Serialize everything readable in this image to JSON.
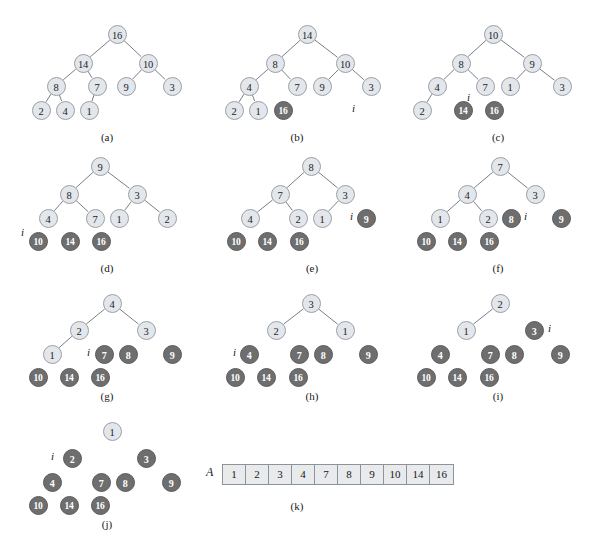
{
  "figure": {
    "colors": {
      "light_node_fill": "#e3e6ea",
      "light_node_stroke": "#9aa0a8",
      "dark_node_fill": "#6e6e6e",
      "dark_node_stroke": "#5a5a5a",
      "edge": "#6b6f75",
      "array_fill": "#e8eaec",
      "array_stroke": "#8d9399",
      "text": "#15181c",
      "background": "#ffffff"
    },
    "index_marker_label": "i",
    "array_name_label": "A"
  },
  "panels": [
    {
      "id": "a",
      "caption": "(a)",
      "caption_pos": [
        107,
        131
      ],
      "index_marker": null,
      "nodes": [
        {
          "label": "16",
          "x": 117,
          "y": 34,
          "shade": "light"
        },
        {
          "label": "14",
          "x": 83,
          "y": 63,
          "shade": "light"
        },
        {
          "label": "10",
          "x": 148,
          "y": 63,
          "shade": "light"
        },
        {
          "label": "8",
          "x": 56,
          "y": 86,
          "shade": "light"
        },
        {
          "label": "7",
          "x": 97,
          "y": 86,
          "shade": "light"
        },
        {
          "label": "9",
          "x": 126,
          "y": 86,
          "shade": "light"
        },
        {
          "label": "3",
          "x": 172,
          "y": 86,
          "shade": "light"
        },
        {
          "label": "2",
          "x": 41,
          "y": 110,
          "shade": "light"
        },
        {
          "label": "4",
          "x": 65,
          "y": 110,
          "shade": "light"
        },
        {
          "label": "1",
          "x": 89,
          "y": 110,
          "shade": "light"
        }
      ],
      "edges": [
        [
          0,
          1
        ],
        [
          0,
          2
        ],
        [
          1,
          3
        ],
        [
          1,
          4
        ],
        [
          2,
          5
        ],
        [
          2,
          6
        ],
        [
          3,
          7
        ],
        [
          3,
          8
        ],
        [
          4,
          9
        ]
      ]
    },
    {
      "id": "b",
      "caption": "(b)",
      "caption_pos": [
        297,
        131
      ],
      "index_marker": {
        "x": 355,
        "y": 110
      },
      "nodes": [
        {
          "label": "14",
          "x": 307,
          "y": 34,
          "shade": "light"
        },
        {
          "label": "8",
          "x": 275,
          "y": 63,
          "shade": "light"
        },
        {
          "label": "10",
          "x": 345,
          "y": 63,
          "shade": "light"
        },
        {
          "label": "4",
          "x": 249,
          "y": 86,
          "shade": "light"
        },
        {
          "label": "7",
          "x": 297,
          "y": 86,
          "shade": "light"
        },
        {
          "label": "9",
          "x": 322,
          "y": 86,
          "shade": "light"
        },
        {
          "label": "3",
          "x": 371,
          "y": 86,
          "shade": "light"
        },
        {
          "label": "2",
          "x": 234,
          "y": 110,
          "shade": "light"
        },
        {
          "label": "1",
          "x": 258,
          "y": 110,
          "shade": "light"
        },
        {
          "label": "16",
          "x": 283,
          "y": 110,
          "shade": "dark"
        }
      ],
      "edges": [
        [
          0,
          1
        ],
        [
          0,
          2
        ],
        [
          1,
          3
        ],
        [
          1,
          4
        ],
        [
          2,
          5
        ],
        [
          2,
          6
        ],
        [
          3,
          7
        ],
        [
          3,
          8
        ]
      ]
    },
    {
      "id": "c",
      "caption": "(c)",
      "caption_pos": [
        498,
        131
      ],
      "index_marker": {
        "x": 470,
        "y": 99
      },
      "nodes": [
        {
          "label": "10",
          "x": 493,
          "y": 34,
          "shade": "light"
        },
        {
          "label": "8",
          "x": 461,
          "y": 63,
          "shade": "light"
        },
        {
          "label": "9",
          "x": 532,
          "y": 63,
          "shade": "light"
        },
        {
          "label": "4",
          "x": 437,
          "y": 86,
          "shade": "light"
        },
        {
          "label": "7",
          "x": 485,
          "y": 86,
          "shade": "light"
        },
        {
          "label": "1",
          "x": 510,
          "y": 86,
          "shade": "light"
        },
        {
          "label": "3",
          "x": 562,
          "y": 86,
          "shade": "light"
        },
        {
          "label": "2",
          "x": 422,
          "y": 110,
          "shade": "light"
        },
        {
          "label": "14",
          "x": 463,
          "y": 110,
          "shade": "dark"
        },
        {
          "label": "16",
          "x": 494,
          "y": 110,
          "shade": "dark"
        }
      ],
      "edges": [
        [
          0,
          1
        ],
        [
          0,
          2
        ],
        [
          1,
          3
        ],
        [
          1,
          4
        ],
        [
          2,
          5
        ],
        [
          2,
          6
        ],
        [
          3,
          7
        ]
      ]
    },
    {
      "id": "d",
      "caption": "(d)",
      "caption_pos": [
        107,
        262
      ],
      "index_marker": {
        "x": 24,
        "y": 234
      },
      "nodes": [
        {
          "label": "9",
          "x": 100,
          "y": 166,
          "shade": "light"
        },
        {
          "label": "8",
          "x": 69,
          "y": 194,
          "shade": "light"
        },
        {
          "label": "3",
          "x": 137,
          "y": 194,
          "shade": "light"
        },
        {
          "label": "4",
          "x": 48,
          "y": 218,
          "shade": "light"
        },
        {
          "label": "7",
          "x": 95,
          "y": 218,
          "shade": "light"
        },
        {
          "label": "1",
          "x": 119,
          "y": 218,
          "shade": "light"
        },
        {
          "label": "2",
          "x": 167,
          "y": 218,
          "shade": "light"
        },
        {
          "label": "10",
          "x": 38,
          "y": 241,
          "shade": "dark"
        },
        {
          "label": "14",
          "x": 70,
          "y": 241,
          "shade": "dark"
        },
        {
          "label": "16",
          "x": 101,
          "y": 241,
          "shade": "dark"
        }
      ],
      "edges": [
        [
          0,
          1
        ],
        [
          0,
          2
        ],
        [
          1,
          3
        ],
        [
          1,
          4
        ],
        [
          2,
          5
        ],
        [
          2,
          6
        ]
      ]
    },
    {
      "id": "e",
      "caption": "(e)",
      "caption_pos": [
        312,
        262
      ],
      "index_marker": {
        "x": 353,
        "y": 218
      },
      "nodes": [
        {
          "label": "8",
          "x": 311,
          "y": 166,
          "shade": "light"
        },
        {
          "label": "7",
          "x": 280,
          "y": 194,
          "shade": "light"
        },
        {
          "label": "3",
          "x": 345,
          "y": 194,
          "shade": "light"
        },
        {
          "label": "4",
          "x": 250,
          "y": 218,
          "shade": "light"
        },
        {
          "label": "2",
          "x": 298,
          "y": 218,
          "shade": "light"
        },
        {
          "label": "1",
          "x": 322,
          "y": 218,
          "shade": "light"
        },
        {
          "label": "9",
          "x": 366,
          "y": 218,
          "shade": "dark"
        },
        {
          "label": "10",
          "x": 236,
          "y": 241,
          "shade": "dark"
        },
        {
          "label": "14",
          "x": 267,
          "y": 241,
          "shade": "dark"
        },
        {
          "label": "16",
          "x": 299,
          "y": 241,
          "shade": "dark"
        }
      ],
      "edges": [
        [
          0,
          1
        ],
        [
          0,
          2
        ],
        [
          1,
          3
        ],
        [
          1,
          4
        ],
        [
          2,
          5
        ]
      ]
    },
    {
      "id": "f",
      "caption": "(f)",
      "caption_pos": [
        498,
        262
      ],
      "index_marker": {
        "x": 527,
        "y": 218
      },
      "nodes": [
        {
          "label": "7",
          "x": 500,
          "y": 166,
          "shade": "light"
        },
        {
          "label": "4",
          "x": 467,
          "y": 194,
          "shade": "light"
        },
        {
          "label": "3",
          "x": 535,
          "y": 194,
          "shade": "light"
        },
        {
          "label": "1",
          "x": 440,
          "y": 218,
          "shade": "light"
        },
        {
          "label": "2",
          "x": 488,
          "y": 218,
          "shade": "light"
        },
        {
          "label": "8",
          "x": 511,
          "y": 218,
          "shade": "dark"
        },
        {
          "label": "9",
          "x": 561,
          "y": 218,
          "shade": "dark"
        },
        {
          "label": "10",
          "x": 426,
          "y": 241,
          "shade": "dark"
        },
        {
          "label": "14",
          "x": 457,
          "y": 241,
          "shade": "dark"
        },
        {
          "label": "16",
          "x": 489,
          "y": 241,
          "shade": "dark"
        }
      ],
      "edges": [
        [
          0,
          1
        ],
        [
          0,
          2
        ],
        [
          1,
          3
        ],
        [
          1,
          4
        ]
      ]
    },
    {
      "id": "g",
      "caption": "(g)",
      "caption_pos": [
        107,
        390
      ],
      "index_marker": {
        "x": 90,
        "y": 354
      },
      "nodes": [
        {
          "label": "4",
          "x": 112,
          "y": 303,
          "shade": "light"
        },
        {
          "label": "2",
          "x": 79,
          "y": 330,
          "shade": "light"
        },
        {
          "label": "3",
          "x": 146,
          "y": 330,
          "shade": "light"
        },
        {
          "label": "1",
          "x": 52,
          "y": 354,
          "shade": "light"
        },
        {
          "label": "7",
          "x": 104,
          "y": 354,
          "shade": "dark"
        },
        {
          "label": "8",
          "x": 128,
          "y": 354,
          "shade": "dark"
        },
        {
          "label": "9",
          "x": 172,
          "y": 354,
          "shade": "dark"
        },
        {
          "label": "10",
          "x": 38,
          "y": 377,
          "shade": "dark"
        },
        {
          "label": "14",
          "x": 69,
          "y": 377,
          "shade": "dark"
        },
        {
          "label": "16",
          "x": 100,
          "y": 377,
          "shade": "dark"
        }
      ],
      "edges": [
        [
          0,
          1
        ],
        [
          0,
          2
        ],
        [
          1,
          3
        ]
      ]
    },
    {
      "id": "h",
      "caption": "(h)",
      "caption_pos": [
        312,
        390
      ],
      "index_marker": {
        "x": 236,
        "y": 354
      },
      "nodes": [
        {
          "label": "3",
          "x": 311,
          "y": 303,
          "shade": "light"
        },
        {
          "label": "2",
          "x": 276,
          "y": 330,
          "shade": "light"
        },
        {
          "label": "1",
          "x": 345,
          "y": 330,
          "shade": "light"
        },
        {
          "label": "4",
          "x": 249,
          "y": 354,
          "shade": "dark"
        },
        {
          "label": "7",
          "x": 299,
          "y": 354,
          "shade": "dark"
        },
        {
          "label": "8",
          "x": 323,
          "y": 354,
          "shade": "dark"
        },
        {
          "label": "9",
          "x": 368,
          "y": 354,
          "shade": "dark"
        },
        {
          "label": "10",
          "x": 235,
          "y": 377,
          "shade": "dark"
        },
        {
          "label": "14",
          "x": 266,
          "y": 377,
          "shade": "dark"
        },
        {
          "label": "16",
          "x": 298,
          "y": 377,
          "shade": "dark"
        }
      ],
      "edges": [
        [
          0,
          1
        ],
        [
          0,
          2
        ]
      ]
    },
    {
      "id": "i",
      "caption": "(i)",
      "caption_pos": [
        498,
        390
      ],
      "index_marker": {
        "x": 551,
        "y": 330
      },
      "nodes": [
        {
          "label": "2",
          "x": 500,
          "y": 303,
          "shade": "light"
        },
        {
          "label": "1",
          "x": 466,
          "y": 330,
          "shade": "light"
        },
        {
          "label": "3",
          "x": 534,
          "y": 330,
          "shade": "dark"
        },
        {
          "label": "4",
          "x": 440,
          "y": 354,
          "shade": "dark"
        },
        {
          "label": "7",
          "x": 490,
          "y": 354,
          "shade": "dark"
        },
        {
          "label": "8",
          "x": 514,
          "y": 354,
          "shade": "dark"
        },
        {
          "label": "9",
          "x": 560,
          "y": 354,
          "shade": "dark"
        },
        {
          "label": "10",
          "x": 426,
          "y": 377,
          "shade": "dark"
        },
        {
          "label": "14",
          "x": 457,
          "y": 377,
          "shade": "dark"
        },
        {
          "label": "16",
          "x": 489,
          "y": 377,
          "shade": "dark"
        }
      ],
      "edges": [
        [
          0,
          1
        ]
      ]
    },
    {
      "id": "j",
      "caption": "(j)",
      "caption_pos": [
        107,
        518
      ],
      "index_marker": {
        "x": 54,
        "y": 458
      },
      "nodes": [
        {
          "label": "1",
          "x": 112,
          "y": 431,
          "shade": "light"
        },
        {
          "label": "2",
          "x": 72,
          "y": 458,
          "shade": "dark"
        },
        {
          "label": "3",
          "x": 146,
          "y": 458,
          "shade": "dark"
        },
        {
          "label": "4",
          "x": 52,
          "y": 482,
          "shade": "dark"
        },
        {
          "label": "7",
          "x": 101,
          "y": 482,
          "shade": "dark"
        },
        {
          "label": "8",
          "x": 125,
          "y": 482,
          "shade": "dark"
        },
        {
          "label": "9",
          "x": 171,
          "y": 482,
          "shade": "dark"
        },
        {
          "label": "10",
          "x": 38,
          "y": 505,
          "shade": "dark"
        },
        {
          "label": "14",
          "x": 69,
          "y": 505,
          "shade": "dark"
        },
        {
          "label": "16",
          "x": 100,
          "y": 505,
          "shade": "dark"
        }
      ],
      "edges": []
    }
  ],
  "array_panel": {
    "id": "k",
    "caption": "(k)",
    "caption_pos": [
      297,
      500
    ],
    "label": "A",
    "label_pos": [
      206,
      465
    ],
    "origin": [
      222,
      464
    ],
    "values": [
      "1",
      "2",
      "3",
      "4",
      "7",
      "8",
      "9",
      "10",
      "14",
      "16"
    ]
  }
}
